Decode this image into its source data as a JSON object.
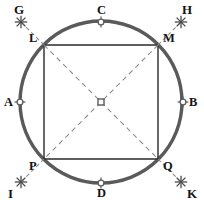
{
  "figure": {
    "canvas": {
      "width": 204,
      "height": 200,
      "background": "#ffffff"
    },
    "colors": {
      "circle_stroke": "#5a5a5a",
      "square_stroke": "#2b2b2b",
      "dashed_stroke": "#8c8c8c",
      "marker_stroke": "#5a5a5a",
      "marker_fill": "#ffffff",
      "star_stroke": "#4a4a4a",
      "label_color": "#141414"
    },
    "circle": {
      "name": "main-circle",
      "center_x": 101,
      "center_y": 102,
      "radius": 81,
      "stroke_width": 3.4
    },
    "center_point": {
      "name": "center-marker",
      "label": "",
      "x": 101,
      "y": 102,
      "marker": "hollow-square",
      "size": 6
    },
    "square": {
      "name": "inscribed-square",
      "stroke_width": 1.4,
      "vertices": [
        {
          "id": "L",
          "label": "L",
          "x": 44,
          "y": 45,
          "label_dx": -15,
          "label_dy": -13,
          "position": "top-left"
        },
        {
          "id": "M",
          "label": "M",
          "x": 158,
          "y": 45,
          "label_dx": 5,
          "label_dy": -13,
          "position": "top-right"
        },
        {
          "id": "Q",
          "label": "Q",
          "x": 158,
          "y": 159,
          "label_dx": 5,
          "label_dy": 1,
          "position": "bottom-right"
        },
        {
          "id": "P",
          "label": "P",
          "x": 44,
          "y": 159,
          "label_dx": -15,
          "label_dy": 1,
          "position": "bottom-left"
        }
      ]
    },
    "cardinal_points": [
      {
        "id": "A",
        "label": "A",
        "x": 20,
        "y": 102,
        "label_dx": -16,
        "label_dy": -6,
        "marker": "crossed-circle",
        "position": "left"
      },
      {
        "id": "B",
        "label": "B",
        "x": 183,
        "y": 102,
        "label_dx": 6,
        "label_dy": -6,
        "marker": "crossed-circle",
        "position": "right"
      },
      {
        "id": "C",
        "label": "C",
        "x": 101,
        "y": 22,
        "label_dx": -4,
        "label_dy": -18,
        "marker": "crossed-circle",
        "position": "top"
      },
      {
        "id": "D",
        "label": "D",
        "x": 101,
        "y": 183,
        "label_dx": -4,
        "label_dy": 4,
        "marker": "crossed-circle",
        "position": "bottom"
      }
    ],
    "diagonals": [
      {
        "name": "diagonal-L-Q",
        "x1": 44,
        "y1": 45,
        "x2": 158,
        "y2": 159,
        "dash": "5,4"
      },
      {
        "name": "diagonal-M-P",
        "x1": 158,
        "y1": 45,
        "x2": 44,
        "y2": 159,
        "dash": "5,4"
      }
    ],
    "rays": [
      {
        "id": "G",
        "label": "G",
        "name": "ray-G",
        "from_x": 44,
        "from_y": 45,
        "to_x": 21,
        "to_y": 22,
        "star_x": 21,
        "star_y": 22,
        "label_dx": -7,
        "label_dy": -19,
        "direction": "up-left"
      },
      {
        "id": "H",
        "label": "H",
        "name": "ray-H",
        "from_x": 158,
        "from_y": 45,
        "to_x": 181,
        "to_y": 22,
        "star_x": 181,
        "star_y": 22,
        "label_dx": 1,
        "label_dy": -19,
        "direction": "up-right"
      },
      {
        "id": "I",
        "label": "I",
        "name": "ray-I",
        "from_x": 44,
        "from_y": 159,
        "to_x": 21,
        "to_y": 182,
        "star_x": 21,
        "star_y": 182,
        "label_dx": -13,
        "label_dy": 5,
        "direction": "down-left"
      },
      {
        "id": "K",
        "label": "K",
        "name": "ray-K",
        "from_x": 158,
        "from_y": 159,
        "to_x": 181,
        "to_y": 182,
        "star_x": 181,
        "star_y": 182,
        "label_dx": 6,
        "label_dy": 5,
        "direction": "down-right"
      }
    ]
  }
}
